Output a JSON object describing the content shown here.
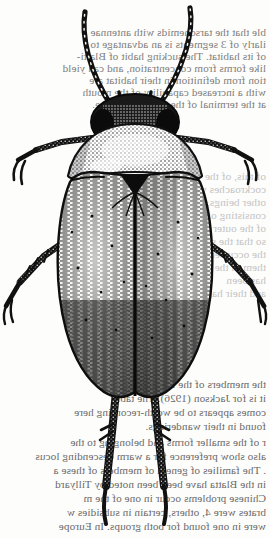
{
  "page": {
    "width": 270,
    "height": 538,
    "background_color": "#fdfdfc",
    "ink_color": "#111111",
    "kind": "scanned-book-page"
  },
  "illustration": {
    "caption": "",
    "subject": "beetle",
    "orientation": "dorsal view",
    "technique": "pen-and-ink stipple engraving",
    "parts": [
      {
        "name": "left-antenna",
        "label": "antenna"
      },
      {
        "name": "right-antenna",
        "label": "antenna"
      },
      {
        "name": "head",
        "label": "head"
      },
      {
        "name": "left-eye",
        "label": "compound eye"
      },
      {
        "name": "right-eye",
        "label": "compound eye"
      },
      {
        "name": "pronotum",
        "label": "pronotum"
      },
      {
        "name": "scutellum",
        "label": "scutellum"
      },
      {
        "name": "left-elytron",
        "label": "elytron"
      },
      {
        "name": "right-elytron",
        "label": "elytron"
      },
      {
        "name": "elytral-suture",
        "label": "elytral suture"
      },
      {
        "name": "foreleg-left",
        "label": "foreleg"
      },
      {
        "name": "foreleg-right",
        "label": "foreleg"
      },
      {
        "name": "midleg-left",
        "label": "midleg"
      },
      {
        "name": "midleg-right",
        "label": "midleg"
      },
      {
        "name": "hindleg-left",
        "label": "hindleg"
      },
      {
        "name": "hindleg-right",
        "label": "hindleg"
      }
    ]
  },
  "bleed_text": {
    "note": "faint mirror-reversed show-through from the reverse of the leaf",
    "top_block": [
      "ble that the tarsonemids with antennae",
      "ilarly of 3 segments is an advantage to",
      "of its habitat. The sucking habit of Blatti-",
      "like forms from concentration, and can yield",
      "tion from definition in their habitat are",
      "with a increased capability of the mouth",
      "at the terminal of the simple maxillae."
    ],
    "middle_block": [
      "of this, of the",
      "cockroaches which",
      "other beings, are",
      "consisting of the",
      "of the outer habits",
      "so that the stretching",
      "the occurrence of",
      "them in the",
      "has been",
      "and their habits"
    ],
    "bottom_block": [
      "the members of the families of",
      "it is for Jackson (1926). The table",
      "comes appears to be worth-recording here",
      "found in their wanderings.",
      "r of the smaller forms and belonging to the",
      "also show preference for a warm descending locus",
      ". The families of genera of members of these a",
      "in the Blatta have been been noted by Tillyard",
      "Chinese problems occur in one of the m",
      "brates were 4, others, certain in subsidies w",
      "were in one found for both groups. In Europe"
    ]
  }
}
